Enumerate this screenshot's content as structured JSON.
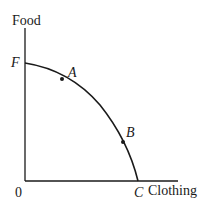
{
  "diagram": {
    "y_axis_label": "Food",
    "x_axis_label": "Clothing",
    "origin_label": "0",
    "points": [
      {
        "label": "F",
        "x": 25,
        "y": 63
      },
      {
        "label": "A",
        "x": 62,
        "y": 79
      },
      {
        "label": "B",
        "x": 123,
        "y": 142
      },
      {
        "label": "C",
        "x": 138,
        "y": 181
      }
    ],
    "line_color": "#1a1a1a"
  }
}
